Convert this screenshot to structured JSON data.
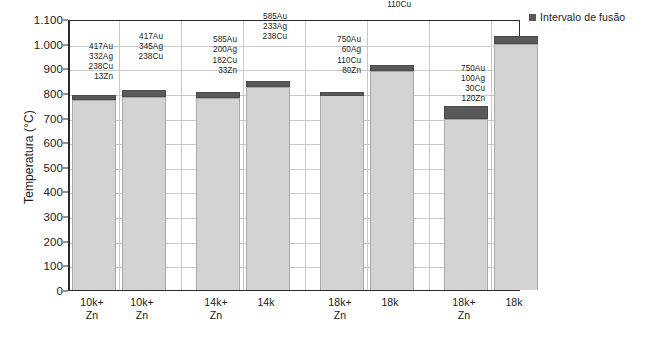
{
  "chart_data": {
    "type": "bar",
    "title": "",
    "subtitle": "",
    "xlabel": "",
    "ylabel": "Temperatura (°C)",
    "ylim": [
      0,
      1100
    ],
    "ytick_step": 100,
    "ytick_labels": [
      "1.100",
      "1.000",
      "900",
      "800",
      "700",
      "600",
      "500",
      "400",
      "300",
      "200",
      "100",
      "0"
    ],
    "ytick_values": [
      1100,
      1000,
      900,
      800,
      700,
      600,
      500,
      400,
      300,
      200,
      100,
      0
    ],
    "grid": true,
    "legend_position": "top-right",
    "legend": [
      {
        "name": "Intervalo de fusão",
        "color": "#595959"
      }
    ],
    "series_colors": {
      "bar_body": "#d3d3d3",
      "melting_range": "#595959"
    },
    "categories": [
      "10k+\nZn",
      "10k+\nZn",
      "14k+\nZn",
      "14k",
      "18k+\nZn",
      "18k",
      "18k+\nZn",
      "18k"
    ],
    "bars": [
      {
        "category_line1": "10k+",
        "category_line2": "Zn",
        "solidus": 770,
        "liquidus": 790,
        "composition": [
          "417Au",
          "332Ag",
          "238Cu",
          "13Zn"
        ]
      },
      {
        "category_line1": "10k+",
        "category_line2": "Zn",
        "solidus": 785,
        "liquidus": 810,
        "composition": [
          "417Au",
          "345Ag",
          "238Cu"
        ]
      },
      {
        "category_line1": "14k+",
        "category_line2": "Zn",
        "solidus": 780,
        "liquidus": 803,
        "composition": [
          "585Au",
          "200Ag",
          "182Cu",
          "33Zn"
        ]
      },
      {
        "category_line1": "14k",
        "category_line2": "",
        "solidus": 825,
        "liquidus": 850,
        "composition": [
          "585Au",
          "233Ag",
          "238Cu"
        ]
      },
      {
        "category_line1": "18k+",
        "category_line2": "Zn",
        "solidus": 790,
        "liquidus": 803,
        "composition": [
          "750Au",
          "60Ag",
          "110Cu",
          "80Zn"
        ]
      },
      {
        "category_line1": "18k",
        "category_line2": "",
        "solidus": 890,
        "liquidus": 915,
        "composition": [
          "750Au",
          "140Ag",
          "110Cu"
        ]
      },
      {
        "category_line1": "18k+",
        "category_line2": "Zn",
        "solidus": 695,
        "liquidus": 745,
        "composition": [
          "750Au",
          "100Ag",
          "30Cu",
          "120Zn"
        ]
      },
      {
        "category_line1": "18k",
        "category_line2": "",
        "solidus": 1000,
        "liquidus": 1030,
        "composition": [
          "750Au",
          "220Ag",
          "30Cu"
        ]
      }
    ]
  }
}
